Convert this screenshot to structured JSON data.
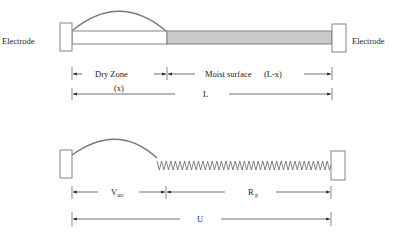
{
  "colors": {
    "outline": "#777777",
    "moist_fill": "#c9c9c9",
    "dry_fill": "#ffffff",
    "text": "#222222"
  },
  "top_panel": {
    "left_electrode_label": "Electrode",
    "right_electrode_label": "Electrode",
    "dry_zone_label": "Dry Zone",
    "dry_zone_length_label": "(x)",
    "moist_surface_label": "Moist  surface",
    "moist_length_label": "(L-x)",
    "total_length_label": "L"
  },
  "bottom_panel": {
    "arc_voltage_label": "V",
    "arc_voltage_subscript": "arc",
    "resistance_label": "R",
    "resistance_subscript": "p",
    "total_voltage_label": "U"
  }
}
